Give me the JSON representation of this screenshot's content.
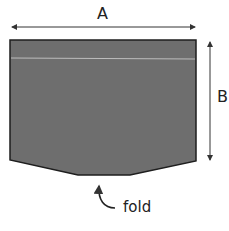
{
  "diagram": {
    "labels": {
      "width": "A",
      "height": "B",
      "fold": "fold"
    },
    "colors": {
      "fill": "#6e6e6e",
      "stroke": "#1e1e1e",
      "fold_line": "#bdbdbd",
      "arrow": "#333333"
    }
  }
}
